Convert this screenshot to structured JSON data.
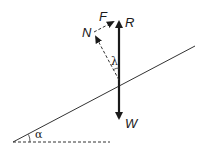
{
  "diagram": {
    "type": "force-diagram-inclined-plane",
    "colors": {
      "stroke": "#1a1a1a",
      "background": "#ffffff"
    },
    "labels": {
      "reaction": "R",
      "weight": "W",
      "normal": "N",
      "friction": "F",
      "angle_of_friction": "λ",
      "angle_of_incline": "α"
    },
    "elements": {
      "incline": {
        "x1": 13,
        "y1": 142,
        "x2": 195,
        "y2": 46
      },
      "horizontal_reference": {
        "x1": 13,
        "y1": 142,
        "x2": 110,
        "y2": 142,
        "style": "dashed"
      },
      "resultant_R": {
        "x1": 119,
        "y1": 85,
        "x2": 119,
        "y2": 18,
        "style": "solid-bold"
      },
      "weight_W": {
        "x1": 119,
        "y1": 85,
        "x2": 119,
        "y2": 122,
        "style": "solid-bold"
      },
      "normal_N": {
        "x1": 119,
        "y1": 80,
        "x2": 94,
        "y2": 33,
        "style": "dashed"
      },
      "friction_F": {
        "x1": 94,
        "y1": 31,
        "x2": 117,
        "y2": 20,
        "style": "dashed"
      }
    }
  }
}
